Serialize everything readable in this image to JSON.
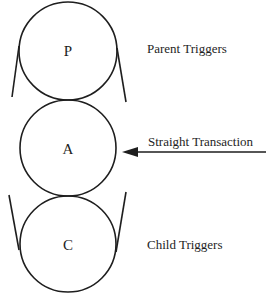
{
  "diagram": {
    "type": "trigger-relationship",
    "colors": {
      "stroke": "#1e1e1e",
      "background": "#ffffff"
    },
    "nodes": [
      {
        "id": "parent",
        "letter": "P",
        "label": "Parent Triggers"
      },
      {
        "id": "active",
        "letter": "A",
        "label": "Straight Transaction"
      },
      {
        "id": "child",
        "letter": "C",
        "label": "Child Triggers"
      }
    ],
    "arrow": {
      "direction": "left",
      "target": "A",
      "label": "Straight Transaction"
    }
  }
}
